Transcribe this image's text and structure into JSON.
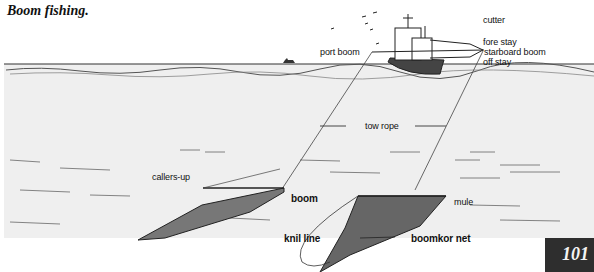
{
  "title": "Boom fishing.",
  "page_number": "101",
  "labels": {
    "cutter": "cutter",
    "fore_stay": "fore stay",
    "starboard_boom": "starboard boom",
    "off_stay": "off stay",
    "port_boom": "port boom",
    "tow_rope": "tow rope",
    "callers_up": "callers-up",
    "boom": "boom",
    "mule": "mule",
    "knil_line": "knil  line",
    "boomkor_net": "boomkor net"
  },
  "colors": {
    "ink": "#111111",
    "sea": "#ededed",
    "page_badge": "#2e2e2e"
  }
}
